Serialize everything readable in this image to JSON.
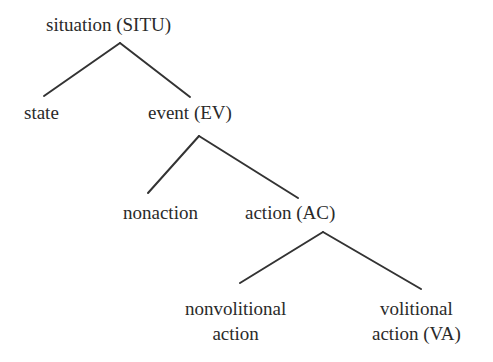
{
  "tree": {
    "nodes": {
      "situation": "situation (SITU)",
      "state": "state",
      "event": "event (EV)",
      "nonaction": "nonaction",
      "action": "action (AC)",
      "nonvolitional_line1": "nonvolitional",
      "nonvolitional_line2": "action",
      "volitional_line1": "volitional",
      "volitional_line2": "action (VA)"
    },
    "edges": [
      [
        "situation (SITU)",
        "state"
      ],
      [
        "situation (SITU)",
        "event (EV)"
      ],
      [
        "event (EV)",
        "nonaction"
      ],
      [
        "event (EV)",
        "action (AC)"
      ],
      [
        "action (AC)",
        "nonvolitional action"
      ],
      [
        "action (AC)",
        "volitional action (VA)"
      ]
    ],
    "line_color": "#333333"
  }
}
